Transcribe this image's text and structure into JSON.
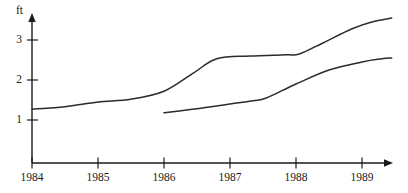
{
  "chart_data": {
    "type": "line",
    "title": "",
    "subtitle": "",
    "xlabel": "",
    "ylabel": "ft",
    "unit_label": "ft",
    "grid": false,
    "legend_position": "none",
    "x_tick_labels": [
      "1984",
      "1985",
      "1986",
      "1987",
      "1988",
      "1989"
    ],
    "x_tick_values": [
      1984,
      1985,
      1986,
      1987,
      1988,
      1989
    ],
    "y_tick_labels": [
      "1",
      "2",
      "3"
    ],
    "y_tick_values": [
      1,
      2,
      3
    ],
    "xlim": [
      1984,
      1989.45
    ],
    "ylim": [
      0,
      3.75
    ],
    "axis_arrows": [
      "x-right",
      "y-up"
    ],
    "series": [
      {
        "name": "upper",
        "x": [
          1984.0,
          1984.5,
          1985.0,
          1985.5,
          1986.0,
          1986.45,
          1986.8,
          1987.3,
          1987.85,
          1988.05,
          1988.4,
          1988.85,
          1989.15,
          1989.45
        ],
        "values": [
          1.27,
          1.33,
          1.45,
          1.52,
          1.72,
          2.18,
          2.53,
          2.6,
          2.63,
          2.65,
          2.92,
          3.28,
          3.45,
          3.55
        ]
      },
      {
        "name": "lower",
        "x": [
          1986.0,
          1986.5,
          1987.0,
          1987.35,
          1987.55,
          1988.0,
          1988.5,
          1989.0,
          1989.3,
          1989.45
        ],
        "values": [
          1.18,
          1.28,
          1.4,
          1.48,
          1.55,
          1.9,
          2.25,
          2.45,
          2.53,
          2.55
        ]
      }
    ]
  },
  "axis": {
    "unit": "ft"
  },
  "x_ticks": [
    {
      "label": "1984"
    },
    {
      "label": "1985"
    },
    {
      "label": "1986"
    },
    {
      "label": "1987"
    },
    {
      "label": "1988"
    },
    {
      "label": "1989"
    }
  ],
  "y_ticks": [
    {
      "label": "3"
    },
    {
      "label": "2"
    },
    {
      "label": "1"
    }
  ]
}
